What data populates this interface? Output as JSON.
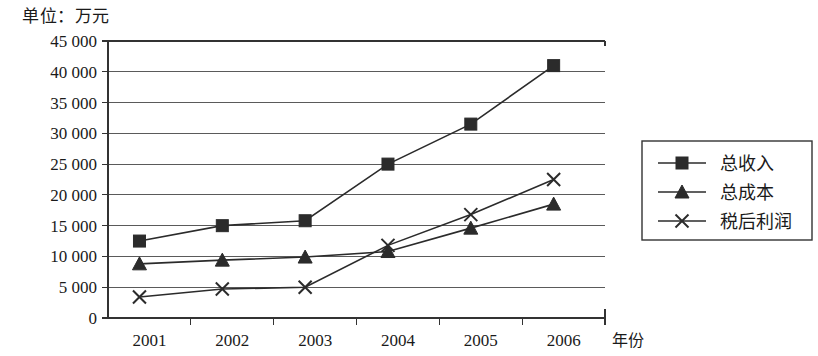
{
  "chart_data": {
    "type": "line",
    "title": "单位：万元",
    "xlabel": "年份",
    "ylabel": "",
    "categories": [
      "2001",
      "2002",
      "2003",
      "2004",
      "2005",
      "2006"
    ],
    "ylim": [
      0,
      45000
    ],
    "ytick_step": 5000,
    "ytick_labels": [
      "0",
      "5 000",
      "10 000",
      "15 000",
      "20 000",
      "25 000",
      "30 000",
      "35 000",
      "40 000",
      "45 000"
    ],
    "ytick_values": [
      0,
      5000,
      10000,
      15000,
      20000,
      25000,
      30000,
      35000,
      40000,
      45000
    ],
    "grid": true,
    "legend_position": "right",
    "series": [
      {
        "name": "总收入",
        "marker": "square",
        "color": "#2b2b2b",
        "values": [
          12500,
          15000,
          15800,
          25000,
          31500,
          41000
        ]
      },
      {
        "name": "总成本",
        "marker": "triangle",
        "color": "#2b2b2b",
        "values": [
          8800,
          9400,
          9900,
          10800,
          14600,
          18500
        ]
      },
      {
        "name": "税后利润",
        "marker": "x",
        "color": "#2b2b2b",
        "values": [
          3400,
          4700,
          5000,
          11800,
          16800,
          22500
        ]
      }
    ]
  }
}
